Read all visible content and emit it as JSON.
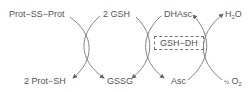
{
  "diagram": {
    "type": "coupled redox reaction cycles",
    "colors": {
      "text": "#555555",
      "arrows": "#666666"
    },
    "top_labels": [
      "Prot−SS−Prot",
      "2 GSH",
      "DHAsc",
      "H2O"
    ],
    "bottom_labels": [
      "2 Prot−SH",
      "GSSG",
      "Asc",
      "½ O2"
    ],
    "enzyme": "GSH−DH",
    "nodes": {
      "prot_ss_prot": "Prot−SS−Prot",
      "two_gsh": "2 GSH",
      "dhasc": "DHAsc",
      "h2o_main": "H",
      "h2o_sub": "2",
      "h2o_tail": "O",
      "two_prot_sh": "2 Prot−SH",
      "gssg": "GSSG",
      "asc": "Asc",
      "o2_frac": "½",
      "o2_main": "O",
      "o2_sub": "2",
      "enzyme_label": "GSH−DH"
    },
    "edges": [
      {
        "from": "Prot−SS−Prot",
        "to": "2 Prot−SH"
      },
      {
        "from": "2 GSH",
        "to": "GSSG"
      },
      {
        "from": "GSSG",
        "to": "Asc"
      },
      {
        "from": "DHAsc",
        "to": "2 GSH"
      },
      {
        "from": "Asc",
        "to": "DHAsc"
      },
      {
        "from": "½ O2",
        "to": "H2O"
      }
    ]
  }
}
